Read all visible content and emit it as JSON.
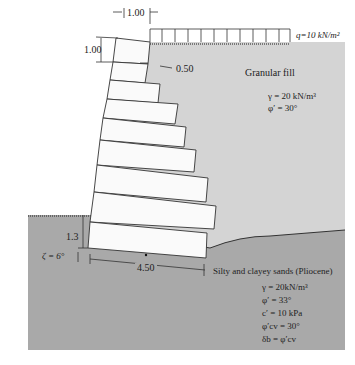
{
  "dimensions": {
    "top_offset": "1.00",
    "block_height": "1.00",
    "step": "0.50",
    "embedment": "1.3",
    "base_width": "4.50",
    "base_tilt": "ζ = 6°"
  },
  "surcharge": {
    "label": "q=10 kN/m²"
  },
  "backfill": {
    "name": "Granular fill",
    "gamma": "γ = 20 kN/m³",
    "phi": "φ′ = 30°"
  },
  "foundation": {
    "name": "Silty and clayey sands (Pliocene)",
    "gamma": "γ = 20kN/m³",
    "phi": "φ′ = 33°",
    "c": "c′ = 10 kPa",
    "phi_cv": "φ′cv = 30°",
    "delta": "δb = φ′cv"
  },
  "colors": {
    "backfill": "#d4d4d4",
    "foundation": "#a9a9a9",
    "block": "#fafafa",
    "line": "#333333"
  }
}
